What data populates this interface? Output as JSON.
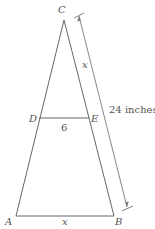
{
  "diagram": {
    "type": "geometry-triangle",
    "points": {
      "A": {
        "label": "A"
      },
      "B": {
        "label": "B"
      },
      "C": {
        "label": "C"
      },
      "D": {
        "label": "D"
      },
      "E": {
        "label": "E"
      }
    },
    "segments": {
      "DE": {
        "label": "6"
      },
      "AB": {
        "label": "x"
      },
      "CE": {
        "label": "x"
      }
    },
    "dimension": {
      "span": "CB",
      "label": "24 inches"
    },
    "colors": {
      "line": "#666666",
      "text": "#555555"
    }
  }
}
